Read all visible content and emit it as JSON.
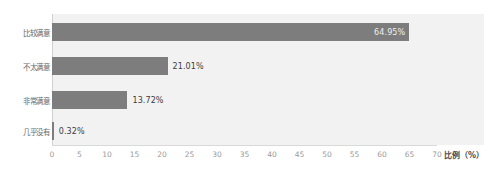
{
  "chart_data": {
    "type": "bar",
    "orientation": "horizontal",
    "title": "",
    "xlabel": "比例（%）",
    "ylabel": "",
    "categories": [
      "比较满意",
      "不太满意",
      "非常满意",
      "几乎没有"
    ],
    "values": [
      64.95,
      21.01,
      13.72,
      0.32
    ],
    "value_labels": [
      "64.95%",
      "21.01%",
      "13.72%",
      "0.32%"
    ],
    "label_placement": [
      "inside",
      "outside",
      "outside",
      "outside"
    ],
    "xlim": [
      0,
      70
    ],
    "xticks": [
      0,
      5,
      10,
      15,
      20,
      25,
      30,
      35,
      40,
      45,
      50,
      55,
      60,
      65,
      70
    ],
    "xtick_labels": [
      "0",
      "5",
      "10",
      "15",
      "20",
      "25",
      "30",
      "35",
      "40",
      "45",
      "50",
      "55",
      "60",
      "65",
      "70"
    ],
    "grid": false,
    "legend": null,
    "bar_color": "#7d7d7d",
    "plot_background": "#f2f2f2",
    "page_background": "#ffffff"
  }
}
